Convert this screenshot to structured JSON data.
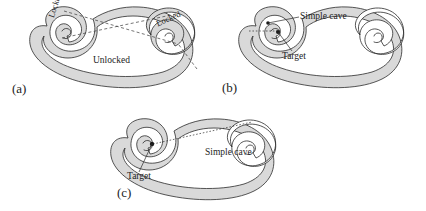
{
  "figure": {
    "background": "#ffffff",
    "band_fill": "#d9d9d9",
    "stroke_color": "#2b2b2b",
    "panels": [
      {
        "id": "a",
        "label": "(a)",
        "labels": [
          {
            "name": "locked-left",
            "text": "Locked"
          },
          {
            "name": "locked-right",
            "text": "Locked"
          },
          {
            "name": "unlocked",
            "text": "Unlocked"
          }
        ]
      },
      {
        "id": "b",
        "label": "(b)",
        "labels": [
          {
            "name": "simple-cave",
            "text": "Simple cave"
          },
          {
            "name": "target",
            "text": "Target"
          }
        ]
      },
      {
        "id": "c",
        "label": "(c)",
        "labels": [
          {
            "name": "simple-cave",
            "text": "Simple cave"
          },
          {
            "name": "target",
            "text": "Target"
          }
        ]
      }
    ]
  },
  "panel_a": {
    "caption": "(a)",
    "locked_left": "Locked",
    "locked_right": "Locked",
    "unlocked": "Unlocked"
  },
  "panel_b": {
    "caption": "(b)",
    "simple_cave": "Simple cave",
    "target": "Target"
  },
  "panel_c": {
    "caption": "(c)",
    "simple_cave": "Simple cave",
    "target": "Target"
  }
}
